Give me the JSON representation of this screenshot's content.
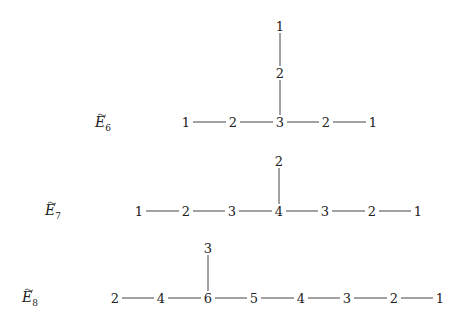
{
  "diagrams": [
    {
      "name": "E6",
      "label": "E",
      "subscript": "6",
      "label_pos": [
        95,
        127
      ],
      "nodes": [
        {
          "id": "a1",
          "value": "1",
          "x": 186,
          "y": 122
        },
        {
          "id": "a2",
          "value": "2",
          "x": 233,
          "y": 122
        },
        {
          "id": "a3",
          "value": "3",
          "x": 280,
          "y": 122
        },
        {
          "id": "a4",
          "value": "2",
          "x": 326,
          "y": 122
        },
        {
          "id": "a5",
          "value": "1",
          "x": 373,
          "y": 122
        },
        {
          "id": "b1",
          "value": "2",
          "x": 280,
          "y": 73
        },
        {
          "id": "b2",
          "value": "1",
          "x": 280,
          "y": 26
        }
      ],
      "edges": [
        [
          "a1",
          "a2"
        ],
        [
          "a2",
          "a3"
        ],
        [
          "a3",
          "a4"
        ],
        [
          "a4",
          "a5"
        ],
        [
          "a3",
          "b1"
        ],
        [
          "b1",
          "b2"
        ]
      ]
    },
    {
      "name": "E7",
      "label": "E",
      "subscript": "7",
      "label_pos": [
        45,
        215
      ],
      "nodes": [
        {
          "id": "a1",
          "value": "1",
          "x": 139,
          "y": 211
        },
        {
          "id": "a2",
          "value": "2",
          "x": 186,
          "y": 211
        },
        {
          "id": "a3",
          "value": "3",
          "x": 232,
          "y": 211
        },
        {
          "id": "a4",
          "value": "4",
          "x": 279,
          "y": 211
        },
        {
          "id": "a5",
          "value": "3",
          "x": 325,
          "y": 211
        },
        {
          "id": "a6",
          "value": "2",
          "x": 372,
          "y": 211
        },
        {
          "id": "a7",
          "value": "1",
          "x": 418,
          "y": 211
        },
        {
          "id": "b1",
          "value": "2",
          "x": 279,
          "y": 161
        }
      ],
      "edges": [
        [
          "a1",
          "a2"
        ],
        [
          "a2",
          "a3"
        ],
        [
          "a3",
          "a4"
        ],
        [
          "a4",
          "a5"
        ],
        [
          "a5",
          "a6"
        ],
        [
          "a6",
          "a7"
        ],
        [
          "a4",
          "b1"
        ]
      ]
    },
    {
      "name": "E8",
      "label": "E",
      "subscript": "8",
      "label_pos": [
        22,
        302
      ],
      "nodes": [
        {
          "id": "a1",
          "value": "2",
          "x": 115,
          "y": 298
        },
        {
          "id": "a2",
          "value": "4",
          "x": 161,
          "y": 298
        },
        {
          "id": "a3",
          "value": "6",
          "x": 208,
          "y": 298
        },
        {
          "id": "a4",
          "value": "5",
          "x": 254,
          "y": 298
        },
        {
          "id": "a5",
          "value": "4",
          "x": 301,
          "y": 298
        },
        {
          "id": "a6",
          "value": "3",
          "x": 347,
          "y": 298
        },
        {
          "id": "a7",
          "value": "2",
          "x": 394,
          "y": 298
        },
        {
          "id": "a8",
          "value": "1",
          "x": 440,
          "y": 298
        },
        {
          "id": "b1",
          "value": "3",
          "x": 208,
          "y": 248
        }
      ],
      "edges": [
        [
          "a1",
          "a2"
        ],
        [
          "a2",
          "a3"
        ],
        [
          "a3",
          "a4"
        ],
        [
          "a4",
          "a5"
        ],
        [
          "a5",
          "a6"
        ],
        [
          "a6",
          "a7"
        ],
        [
          "a7",
          "a8"
        ],
        [
          "a3",
          "b1"
        ]
      ]
    }
  ]
}
